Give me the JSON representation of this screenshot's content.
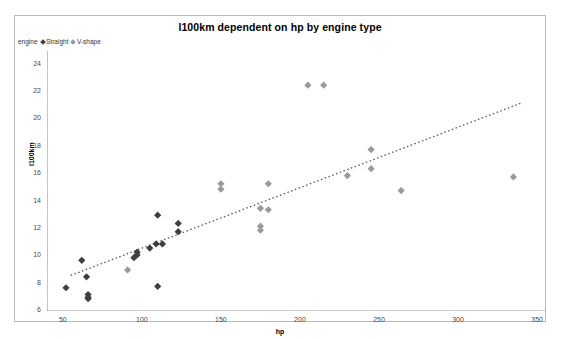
{
  "chart_data": {
    "type": "scatter",
    "title": "l100km dependent on hp by engine type",
    "xlabel": "hp",
    "ylabel": "l100km",
    "xlim": [
      40,
      355
    ],
    "ylim": [
      6,
      25
    ],
    "grid": false,
    "legend_position": "top-left",
    "legend_title": "engine",
    "xticks": [
      50,
      100,
      150,
      200,
      250,
      300,
      350
    ],
    "yticks": [
      6,
      8,
      10,
      12,
      14,
      16,
      18,
      20,
      22,
      24
    ],
    "series": [
      {
        "name": "Straight",
        "color": "#3f3f3f",
        "marker": "diamond",
        "points": [
          [
            52,
            7.7
          ],
          [
            62,
            9.7
          ],
          [
            65,
            8.5
          ],
          [
            66,
            7.0
          ],
          [
            66,
            6.9
          ],
          [
            66,
            7.2
          ],
          [
            95,
            9.9
          ],
          [
            97,
            10.3
          ],
          [
            97,
            10.1
          ],
          [
            105,
            10.6
          ],
          [
            109,
            10.9
          ],
          [
            110,
            13.0
          ],
          [
            110,
            7.8
          ],
          [
            113,
            10.9
          ],
          [
            123,
            12.4
          ],
          [
            123,
            11.8
          ]
        ]
      },
      {
        "name": "V-shape",
        "color": "#9a9a9a",
        "marker": "diamond",
        "points": [
          [
            91,
            9.0
          ],
          [
            150,
            15.3
          ],
          [
            150,
            14.9
          ],
          [
            175,
            12.2
          ],
          [
            175,
            11.9
          ],
          [
            175,
            13.5
          ],
          [
            180,
            15.3
          ],
          [
            180,
            13.4
          ],
          [
            205,
            22.5
          ],
          [
            215,
            22.5
          ],
          [
            230,
            15.9
          ],
          [
            245,
            17.8
          ],
          [
            245,
            16.4
          ],
          [
            264,
            14.8
          ],
          [
            335,
            15.8
          ]
        ]
      }
    ],
    "trendline": {
      "style": "dotted",
      "color": "#555555",
      "x0": 55,
      "y0": 8.6,
      "x1": 340,
      "y1": 21.2
    }
  }
}
